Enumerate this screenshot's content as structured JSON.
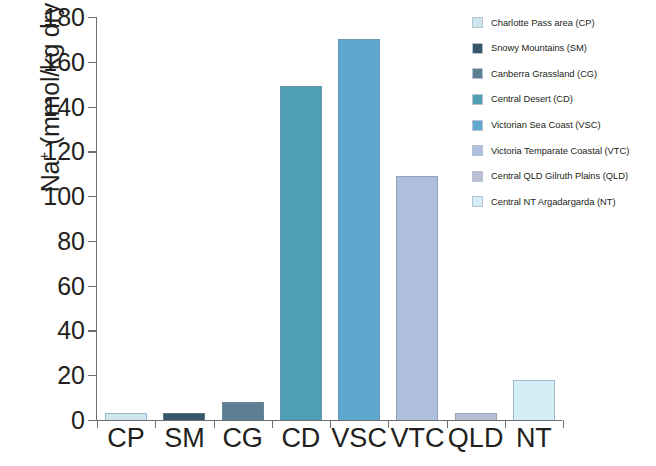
{
  "chart_data": {
    "type": "bar",
    "title": "",
    "xlabel": "",
    "ylabel": "Na+ (mmol/kg dry weight)",
    "ylabel_html": "Na⁺ (mmol/kg dry weight)",
    "categories": [
      "CP",
      "SM",
      "CG",
      "CD",
      "VSC",
      "VTC",
      "QLD",
      "NT"
    ],
    "values": [
      3,
      3,
      8,
      149,
      170,
      109,
      3,
      18
    ],
    "ylim": [
      0,
      180
    ],
    "yticks": [
      0,
      20,
      40,
      60,
      80,
      100,
      120,
      140,
      160,
      180
    ],
    "ytick_labels": [
      "0",
      "20",
      "40",
      "60",
      "80",
      "100",
      "120",
      "140",
      "160",
      "180"
    ],
    "grid": false,
    "legend_position": "top-right",
    "bar_colors": [
      "#cfe6ef",
      "#35566b",
      "#5c7f94",
      "#4f9fb5",
      "#5ea7cf",
      "#aebfde",
      "#b9bed4",
      "#d3eef7"
    ],
    "series": [
      {
        "name": "Na+ content",
        "values": [
          3,
          3,
          8,
          149,
          170,
          109,
          3,
          18
        ]
      }
    ],
    "legend": [
      {
        "label": "Charlotte Pass area (CP)",
        "color": "#cfe6ef",
        "code": "CP",
        "value": 3
      },
      {
        "label": "Snowy Mountains (SM)",
        "color": "#35566b",
        "code": "SM",
        "value": 3
      },
      {
        "label": "Canberra Grassland (CG)",
        "color": "#5c7f94",
        "code": "CG",
        "value": 8
      },
      {
        "label": "Central Desert (CD)",
        "color": "#4f9fb5",
        "code": "CD",
        "value": 149
      },
      {
        "label": "Victorian Sea Coast (VSC)",
        "color": "#5ea7cf",
        "code": "VSC",
        "value": 170
      },
      {
        "label": "Victoria Temparate Coastal (VTC)",
        "color": "#aebfde",
        "code": "VTC",
        "value": 109
      },
      {
        "label": "Central QLD Gilruth Plains (QLD)",
        "color": "#b9bed4",
        "code": "QLD",
        "value": 3
      },
      {
        "label": "Central NT Argadargarda (NT)",
        "color": "#d3eef7",
        "code": "NT",
        "value": 18
      }
    ]
  }
}
